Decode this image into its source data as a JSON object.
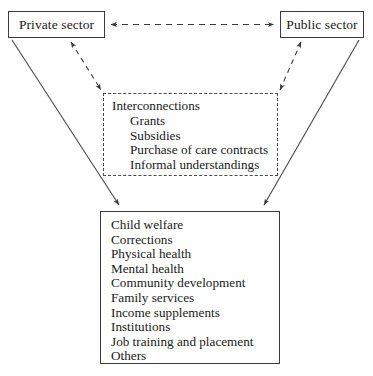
{
  "diagram": {
    "type": "flow-diagram",
    "nodes": {
      "private_sector": {
        "label": "Private sector",
        "shape": "rectangle",
        "border": "solid"
      },
      "public_sector": {
        "label": "Public sector",
        "shape": "rectangle",
        "border": "solid"
      },
      "interconnections": {
        "heading": "Interconnections",
        "shape": "rectangle",
        "border": "dashed",
        "items": [
          "Grants",
          "Subsidies",
          "Purchase of care contracts",
          "Informal understandings"
        ]
      },
      "services": {
        "shape": "rectangle",
        "border": "solid",
        "items": [
          "Child welfare",
          "Corrections",
          "Physical health",
          "Mental health",
          "Community development",
          "Family services",
          "Income supplements",
          "Institutions",
          "Job training and placement",
          "Others"
        ]
      }
    },
    "connectors": [
      {
        "name": "private-public-link",
        "from": "private_sector",
        "to": "public_sector",
        "style": "dashed",
        "arrows": "both"
      },
      {
        "name": "private-interconnections-link",
        "from": "private_sector",
        "to": "interconnections",
        "style": "dashed",
        "arrows": "both"
      },
      {
        "name": "public-interconnections-link",
        "from": "public_sector",
        "to": "interconnections",
        "style": "dashed",
        "arrows": "both"
      },
      {
        "name": "private-services-link",
        "from": "private_sector",
        "to": "services",
        "style": "solid",
        "arrows": "end"
      },
      {
        "name": "public-services-link",
        "from": "public_sector",
        "to": "services",
        "style": "solid",
        "arrows": "end"
      }
    ],
    "colors": {
      "background": "#ffffff",
      "stroke": "#3c3c3c",
      "text": "#1a1a1a"
    }
  }
}
